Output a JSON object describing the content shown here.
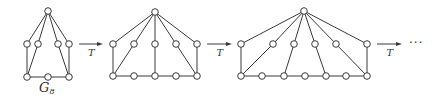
{
  "diagram": {
    "graphs": [
      {
        "id": "g1",
        "label": "G",
        "label_sub": "8",
        "vertices": {
          "top": [
            48,
            11
          ],
          "middle": [
            [
              27,
              44
            ],
            [
              38,
              44
            ],
            [
              58,
              44
            ],
            [
              69,
              44
            ]
          ],
          "bottom": [
            [
              27,
              77
            ],
            [
              48,
              77
            ],
            [
              69,
              77
            ]
          ]
        },
        "edges": [
          [
            "top",
            "m0"
          ],
          [
            "top",
            "m1"
          ],
          [
            "top",
            "m2"
          ],
          [
            "top",
            "m3"
          ],
          [
            "m0",
            "b0"
          ],
          [
            "m1",
            "b0"
          ],
          [
            "m2",
            "b2"
          ],
          [
            "m3",
            "b2"
          ],
          [
            "b0",
            "b1"
          ],
          [
            "b1",
            "b2"
          ]
        ]
      },
      {
        "id": "g2",
        "vertices": {
          "top": [
            155,
            12
          ],
          "middle": [
            [
              113,
              44
            ],
            [
              134,
              44
            ],
            [
              155,
              44
            ],
            [
              176,
              44
            ],
            [
              197,
              44
            ]
          ],
          "bottom": [
            [
              113,
              76
            ],
            [
              134,
              76
            ],
            [
              155,
              76
            ],
            [
              176,
              76
            ],
            [
              197,
              76
            ]
          ]
        },
        "edges": [
          [
            "top",
            "m0"
          ],
          [
            "top",
            "m1"
          ],
          [
            "top",
            "m2"
          ],
          [
            "top",
            "m3"
          ],
          [
            "top",
            "m4"
          ],
          [
            "m0",
            "b0"
          ],
          [
            "m1",
            "b0"
          ],
          [
            "m2",
            "b2"
          ],
          [
            "m3",
            "b4"
          ],
          [
            "m4",
            "b4"
          ],
          [
            "b0",
            "b1"
          ],
          [
            "b1",
            "b2"
          ],
          [
            "b2",
            "b3"
          ],
          [
            "b3",
            "b4"
          ]
        ]
      },
      {
        "id": "g3",
        "vertices": {
          "top": [
            304,
            11
          ],
          "middle": [
            [
              241,
              44
            ],
            [
              273,
              44
            ],
            [
              294,
              44
            ],
            [
              315,
              44
            ],
            [
              336,
              44
            ],
            [
              367,
              44
            ]
          ],
          "bottom": [
            [
              241,
              76
            ],
            [
              262,
              76
            ],
            [
              284,
              76
            ],
            [
              305,
              76
            ],
            [
              326,
              76
            ],
            [
              346,
              76
            ],
            [
              367,
              76
            ]
          ]
        },
        "edges": [
          [
            "top",
            "m0"
          ],
          [
            "top",
            "m1"
          ],
          [
            "top",
            "m2"
          ],
          [
            "top",
            "m3"
          ],
          [
            "top",
            "m4"
          ],
          [
            "top",
            "m5"
          ],
          [
            "m0",
            "b0"
          ],
          [
            "m1",
            "b0"
          ],
          [
            "m2",
            "b2"
          ],
          [
            "m3",
            "b4"
          ],
          [
            "m4",
            "b6"
          ],
          [
            "m5",
            "b6"
          ],
          [
            "b0",
            "b1"
          ],
          [
            "b1",
            "b2"
          ],
          [
            "b2",
            "b3"
          ],
          [
            "b3",
            "b4"
          ],
          [
            "b4",
            "b5"
          ],
          [
            "b5",
            "b6"
          ]
        ]
      }
    ],
    "arrows": [
      {
        "x1": 79,
        "x2": 103,
        "y": 44,
        "label": "T"
      },
      {
        "x1": 207,
        "x2": 232,
        "y": 44,
        "label": "T"
      },
      {
        "x1": 377,
        "x2": 402,
        "y": 44,
        "label": "T"
      }
    ],
    "continuation": "···",
    "vertex_radius": 3.3
  }
}
